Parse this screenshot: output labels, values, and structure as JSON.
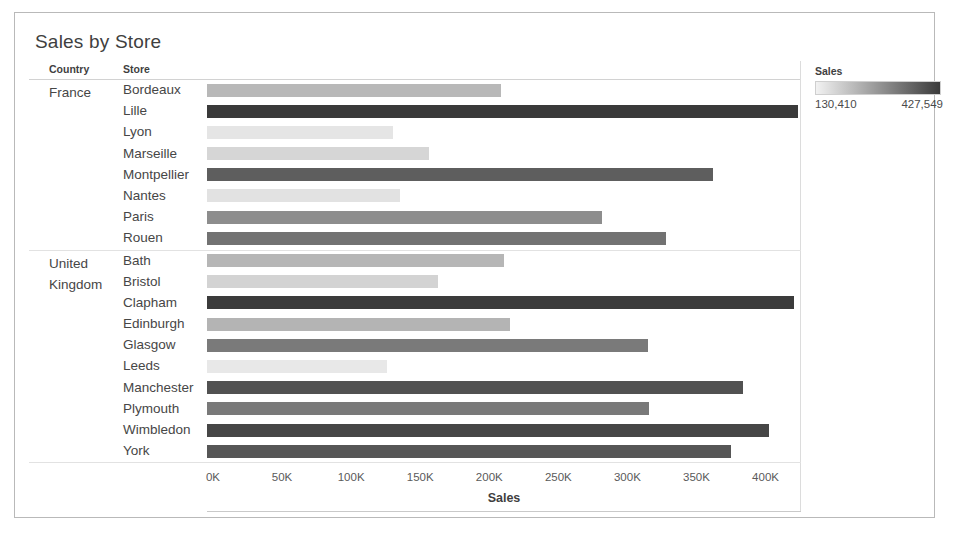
{
  "title": "Sales by Store",
  "columns": {
    "country": "Country",
    "store": "Store"
  },
  "legend": {
    "title": "Sales",
    "min_label": "130,410",
    "max_label": "427,549",
    "min": 130410,
    "max": 427549,
    "color_low": "#f2f2f2",
    "color_high": "#3a3a3a"
  },
  "axis": {
    "title": "Sales",
    "ticks": [
      "0K",
      "50K",
      "100K",
      "150K",
      "200K",
      "250K",
      "300K",
      "350K",
      "400K"
    ]
  },
  "chart_data": {
    "type": "bar",
    "orientation": "horizontal",
    "title": "Sales by Store",
    "xlabel": "Sales",
    "ylabel": "",
    "xlim": [
      0,
      430000
    ],
    "grid": false,
    "legend_position": "right",
    "color_encoding": {
      "field": "Sales",
      "scale": "sequential-gray",
      "domain": [
        130410,
        427549
      ]
    },
    "groups": [
      {
        "country": "France",
        "rows": [
          {
            "store": "Bordeaux",
            "value": 213000
          },
          {
            "store": "Lille",
            "value": 427549
          },
          {
            "store": "Lyon",
            "value": 135000
          },
          {
            "store": "Marseille",
            "value": 161000
          },
          {
            "store": "Montpellier",
            "value": 366000
          },
          {
            "store": "Nantes",
            "value": 140000
          },
          {
            "store": "Paris",
            "value": 286000
          },
          {
            "store": "Rouen",
            "value": 332000
          }
        ]
      },
      {
        "country": "United Kingdom",
        "rows": [
          {
            "store": "Bath",
            "value": 215000
          },
          {
            "store": "Bristol",
            "value": 167000
          },
          {
            "store": "Clapham",
            "value": 425000
          },
          {
            "store": "Edinburgh",
            "value": 219000
          },
          {
            "store": "Glasgow",
            "value": 319000
          },
          {
            "store": "Leeds",
            "value": 130410
          },
          {
            "store": "Manchester",
            "value": 388000
          },
          {
            "store": "Plymouth",
            "value": 320000
          },
          {
            "store": "Wimbledon",
            "value": 407000
          },
          {
            "store": "York",
            "value": 379000
          }
        ]
      }
    ]
  }
}
